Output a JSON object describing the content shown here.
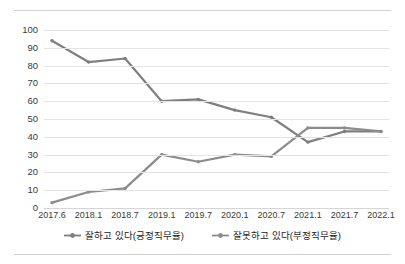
{
  "chart_data": {
    "type": "line",
    "title": "",
    "subtitle": "",
    "xlabel": "",
    "ylabel": "",
    "categories": [
      "2017.6",
      "2018.1",
      "2018.7",
      "2019.1",
      "2019.7",
      "2020.1",
      "2020.7",
      "2021.1",
      "2021.7",
      "2022.1"
    ],
    "series": [
      {
        "name": "잘하고 있다(긍정직무율)",
        "color": "#7f7f7f",
        "marker": "line-with-dot",
        "values": [
          94,
          82,
          84,
          60,
          61,
          55,
          51,
          37,
          43,
          43
        ]
      },
      {
        "name": "잘못하고 있다(부정직무율)",
        "color": "#8c8c8c",
        "marker": "line-with-dot",
        "values": [
          3,
          9,
          11,
          30,
          26,
          30,
          29,
          45,
          45,
          43
        ]
      }
    ],
    "ylim": [
      0,
      100
    ],
    "yticks": [
      0,
      10,
      20,
      30,
      40,
      50,
      60,
      70,
      80,
      90,
      100
    ],
    "ytick_labels": [
      "0",
      "10",
      "20",
      "30",
      "40",
      "50",
      "60",
      "70",
      "80",
      "90",
      "100"
    ],
    "grid": true,
    "grid_axis": "y",
    "legend_position": "bottom",
    "legend": [
      "잘하고 있다(긍정직무율)",
      "잘못하고 있다(부정직무율)"
    ],
    "annotations": []
  },
  "figure": {
    "background_color": "#ffffff",
    "gridline_color": "#e3e3e3",
    "axis_text_color": "#3a3a3a",
    "frame_rule_color": "#d0d0d0"
  }
}
